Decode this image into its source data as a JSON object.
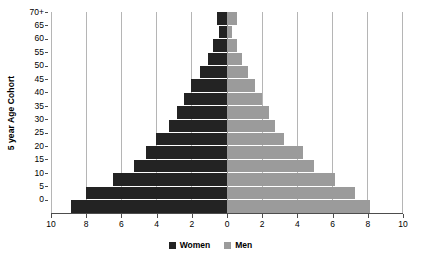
{
  "chart_data": {
    "type": "bar",
    "subtype": "population-pyramid",
    "title": "",
    "xlabel": "",
    "ylabel": "5 year Age Cohort",
    "categories": [
      "0",
      "5",
      "10",
      "15",
      "20",
      "25",
      "30",
      "35",
      "40",
      "45",
      "50",
      "55",
      "60",
      "65",
      "70+"
    ],
    "series": [
      {
        "name": "Women",
        "color": "#232323",
        "direction": "left",
        "values": [
          8.85,
          8.0,
          6.45,
          5.3,
          4.57,
          4.0,
          3.3,
          2.8,
          2.4,
          2.05,
          1.5,
          1.05,
          0.75,
          0.4,
          0.57
        ]
      },
      {
        "name": "Men",
        "color": "#9b9b9b",
        "direction": "right",
        "values": [
          8.2,
          7.3,
          6.2,
          5.0,
          4.35,
          3.3,
          2.75,
          2.45,
          2.05,
          1.6,
          1.2,
          0.9,
          0.6,
          0.3,
          0.6
        ]
      }
    ],
    "x_axis": {
      "tick_labels": [
        "10",
        "8",
        "6",
        "4",
        "2",
        "0",
        "2",
        "4",
        "6",
        "8",
        "10"
      ],
      "tick_values": [
        -10,
        -8,
        -6,
        -4,
        -2,
        0,
        2,
        4,
        6,
        8,
        10
      ],
      "xlim": [
        -10,
        10
      ],
      "grid": true
    },
    "y_axis": {
      "tick_labels": [
        "0",
        "5",
        "10",
        "15",
        "20",
        "25",
        "30",
        "35",
        "40",
        "45",
        "50",
        "55",
        "60",
        "65",
        "70+"
      ],
      "grid": false
    },
    "legend": {
      "position": "bottom",
      "entries": [
        {
          "label": "Women",
          "color": "#232323"
        },
        {
          "label": "Men",
          "color": "#9b9b9b"
        }
      ]
    }
  }
}
